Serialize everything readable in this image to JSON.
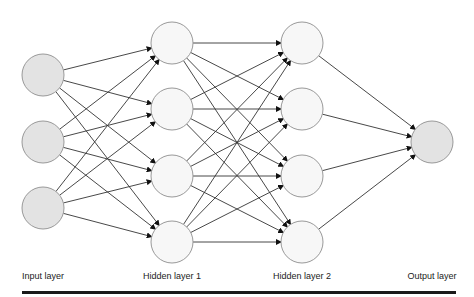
{
  "diagram": {
    "layers": [
      {
        "label": "Input layer",
        "x": 43,
        "node_ys": [
          75,
          142,
          208
        ],
        "fill": "#e3e3e3"
      },
      {
        "label": "Hidden layer 1",
        "x": 172,
        "node_ys": [
          43,
          109,
          176,
          242
        ],
        "fill": "#f7f7f7"
      },
      {
        "label": "Hidden layer 2",
        "x": 302,
        "node_ys": [
          43,
          109,
          176,
          242
        ],
        "fill": "#f7f7f7"
      },
      {
        "label": "Output layer",
        "x": 432,
        "node_ys": [
          142
        ],
        "fill": "#e3e3e3"
      }
    ],
    "node_radius": 21,
    "node_stroke": "#999999",
    "edge_color": "#333333",
    "connections": "fully-connected between adjacent layers"
  }
}
